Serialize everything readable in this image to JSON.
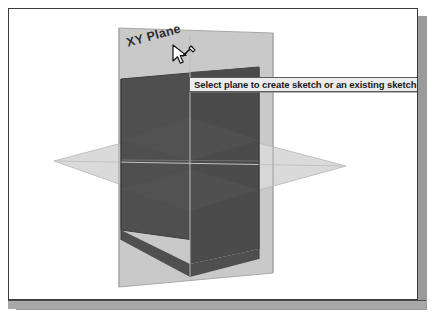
{
  "app": {
    "type": "cad-viewport",
    "background": "#ffffff"
  },
  "viewport": {
    "label": "3d-origin-planes",
    "planes": [
      {
        "name": "back-vertical-plane",
        "state": "unselected",
        "fill": "#c9c9c9",
        "stroke": "#9b9b9b"
      },
      {
        "name": "front-vertical-plane",
        "state": "highlighted",
        "fill": "#4f4f4f",
        "stroke": "#3a3a3a"
      },
      {
        "name": "horizontal-xy-plane",
        "state": "unselected",
        "fill": "#d8d8d8",
        "stroke": "#b4b4b4"
      }
    ],
    "axis_line_color": "#b9b9b9"
  },
  "plane_label": {
    "text": "XY Plane",
    "color": "#2b2b2b"
  },
  "tooltip": {
    "text": "Select plane to create sketch or an existing sketch to edit",
    "background": "#ececec",
    "border": "#5d5d5d",
    "text_color": "#1a1a1a"
  },
  "cursor": {
    "icon": "arrow-sketch-cursor"
  },
  "frame": {
    "border_color": "#3b3b3b",
    "shadow_color": "#9a9a9a",
    "band_color": "#a8a8a8"
  }
}
